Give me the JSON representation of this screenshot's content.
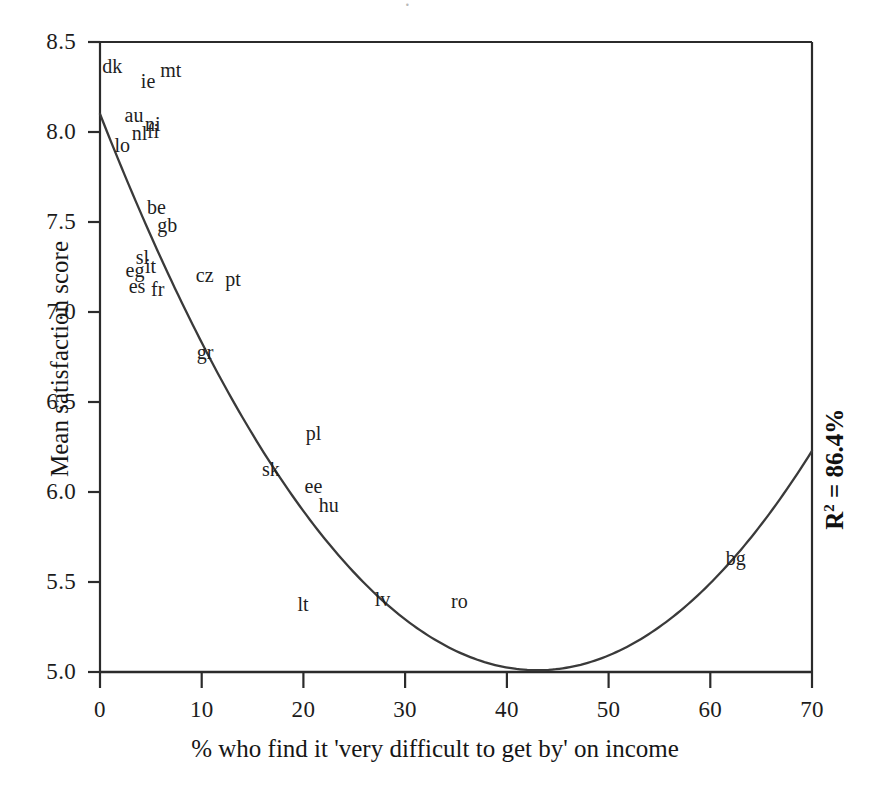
{
  "chart_data": {
    "type": "scatter",
    "title": "",
    "xlabel": "% who find it 'very difficult to get by' on income",
    "ylabel": "Mean satisfaction score",
    "xlim": [
      0,
      70
    ],
    "ylim": [
      5.0,
      8.5
    ],
    "xticks": [
      "0",
      "10",
      "20",
      "30",
      "40",
      "50",
      "60",
      "70"
    ],
    "yticks": [
      "5.0",
      "5.5",
      "6.0",
      "6.5",
      "7.0",
      "7.5",
      "8.0",
      "8.5"
    ],
    "grid": false,
    "legend": null,
    "annotations": [
      {
        "name": "r-squared",
        "text": "R2 = 86.4%",
        "r_label": "R",
        "r_exponent": "2",
        "r_value": " = 86.4%",
        "rotation": -90,
        "position": "right-edge"
      }
    ],
    "points": [
      {
        "label": "dk",
        "x": 1.2,
        "y": 8.36
      },
      {
        "label": "ie",
        "x": 5.0,
        "y": 8.28
      },
      {
        "label": "mt",
        "x": 6.9,
        "y": 8.34
      },
      {
        "label": "au",
        "x": 3.4,
        "y": 8.09
      },
      {
        "label": "ni",
        "x": 5.4,
        "y": 8.04
      },
      {
        "label": "lo",
        "x": 2.4,
        "y": 7.92
      },
      {
        "label": "nl",
        "x": 4.1,
        "y": 7.99
      },
      {
        "label": "fi",
        "x": 5.6,
        "y": 8.0
      },
      {
        "label": "be",
        "x": 5.6,
        "y": 7.58
      },
      {
        "label": "gb",
        "x": 6.6,
        "y": 7.48
      },
      {
        "label": "sl",
        "x": 4.5,
        "y": 7.3
      },
      {
        "label": "eg",
        "x": 3.5,
        "y": 7.23
      },
      {
        "label": "it",
        "x": 5.4,
        "y": 7.25
      },
      {
        "label": "es",
        "x": 3.8,
        "y": 7.14
      },
      {
        "label": "fr",
        "x": 6.0,
        "y": 7.12
      },
      {
        "label": "cz",
        "x": 10.4,
        "y": 7.2
      },
      {
        "label": "pt",
        "x": 13.3,
        "y": 7.18
      },
      {
        "label": "gr",
        "x": 10.5,
        "y": 6.77
      },
      {
        "label": "pl",
        "x": 21.2,
        "y": 6.32
      },
      {
        "label": "sk",
        "x": 16.9,
        "y": 6.12
      },
      {
        "label": "ee",
        "x": 21.1,
        "y": 6.03
      },
      {
        "label": "hu",
        "x": 22.5,
        "y": 5.92
      },
      {
        "label": "bg",
        "x": 62.5,
        "y": 5.63
      },
      {
        "label": "lt",
        "x": 20.4,
        "y": 5.37
      },
      {
        "label": "lv",
        "x": 28.0,
        "y": 5.4
      },
      {
        "label": "ro",
        "x": 35.5,
        "y": 5.39
      }
    ],
    "fit_curve": {
      "name": "quadratic-fit",
      "type": "quadratic",
      "description": "Fitted quadratic regression curve",
      "r_squared_percent": 86.4,
      "vertex": {
        "x": 43.0,
        "y": 5.01
      },
      "endpoints": [
        {
          "x": 0,
          "y": 8.1
        },
        {
          "x": 70,
          "y": 5.99
        }
      ],
      "sample_points": [
        {
          "x": 0,
          "y": 8.1
        },
        {
          "x": 5,
          "y": 7.68
        },
        {
          "x": 10,
          "y": 7.1
        },
        {
          "x": 15,
          "y": 6.58
        },
        {
          "x": 20,
          "y": 6.12
        },
        {
          "x": 25,
          "y": 5.72
        },
        {
          "x": 30,
          "y": 5.43
        },
        {
          "x": 35,
          "y": 5.19
        },
        {
          "x": 40,
          "y": 5.05
        },
        {
          "x": 43,
          "y": 5.01
        },
        {
          "x": 45,
          "y": 5.02
        },
        {
          "x": 50,
          "y": 5.13
        },
        {
          "x": 55,
          "y": 5.33
        },
        {
          "x": 60,
          "y": 5.58
        },
        {
          "x": 65,
          "y": 5.77
        },
        {
          "x": 70,
          "y": 5.99
        }
      ]
    },
    "colors": {
      "axis": "#2b2b2b",
      "curve": "#3a3a3a",
      "text": "#1a1a1a",
      "background": "#ffffff"
    }
  },
  "artifact": {
    "glyph": "·"
  }
}
